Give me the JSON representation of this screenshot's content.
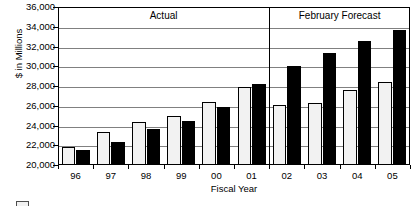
{
  "chart_data": {
    "type": "bar",
    "title": "",
    "xlabel": "Fiscal Year",
    "ylabel": "$ in Millions",
    "categories": [
      "96",
      "97",
      "98",
      "99",
      "00",
      "01",
      "02",
      "03",
      "04",
      "05"
    ],
    "ylim": [
      20000,
      36000
    ],
    "yticks": [
      "20,000",
      "22,000",
      "24,000",
      "26,000",
      "28,000",
      "30,000",
      "32,000",
      "34,000",
      "36,000"
    ],
    "ytick_values": [
      20000,
      22000,
      24000,
      26000,
      28000,
      30000,
      32000,
      34000,
      36000
    ],
    "grid": true,
    "legend_position": "bottom-left",
    "series": [
      {
        "name": "Prior Estimate",
        "style": "light",
        "values": [
          21850,
          23350,
          24400,
          25000,
          26400,
          27950,
          26100,
          26300,
          27600,
          28450
        ]
      },
      {
        "name": "Current",
        "style": "dark",
        "values": [
          21550,
          22300,
          23600,
          24450,
          25900,
          28200,
          30000,
          31300,
          32550,
          33700
        ]
      }
    ],
    "annotations": [
      {
        "text": "Actual",
        "region_start": "96",
        "region_end": "01"
      },
      {
        "text": "February Forecast",
        "region_start": "02",
        "region_end": "05"
      }
    ],
    "divider_after_category": "01"
  },
  "legend": {
    "swatch_label": ""
  }
}
